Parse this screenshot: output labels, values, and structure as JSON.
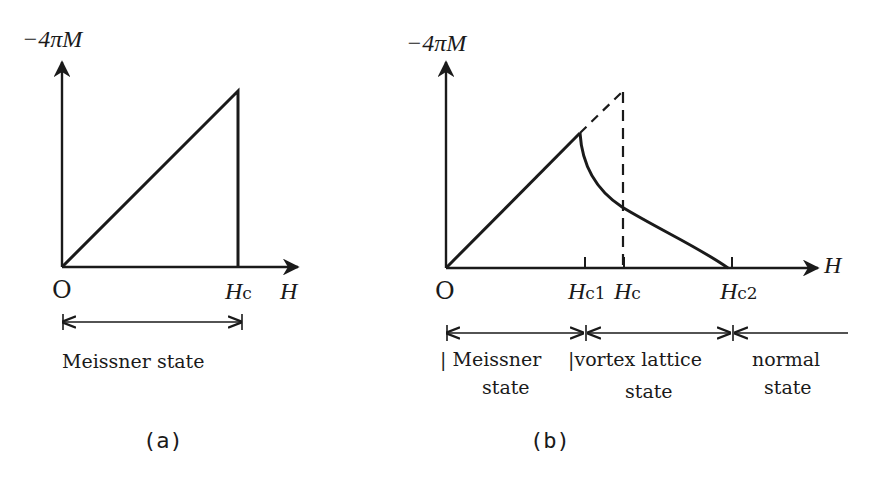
{
  "panel_a": {
    "y_axis_label": "−4πM",
    "x_axis_label": "H",
    "origin_label": "O",
    "tick_labels": [
      {
        "main": "H",
        "sub": "c"
      }
    ],
    "region_labels": [
      "Meissner state"
    ],
    "caption": "(a)"
  },
  "panel_b": {
    "y_axis_label": "−4πM",
    "x_axis_label": "H",
    "origin_label": "O",
    "tick_labels": [
      {
        "main": "H",
        "sub": "c1"
      },
      {
        "main": "H",
        "sub": "c"
      },
      {
        "main": "H",
        "sub": "c2"
      }
    ],
    "region_labels": [
      {
        "line1": "| Meissner",
        "line2": "state"
      },
      {
        "line1": "|vortex lattice",
        "line2": "state"
      },
      {
        "line1": "normal",
        "line2": "state"
      }
    ],
    "caption": "(b)"
  },
  "colors": {
    "ink": "#1a1a1a",
    "background": "#ffffff"
  }
}
